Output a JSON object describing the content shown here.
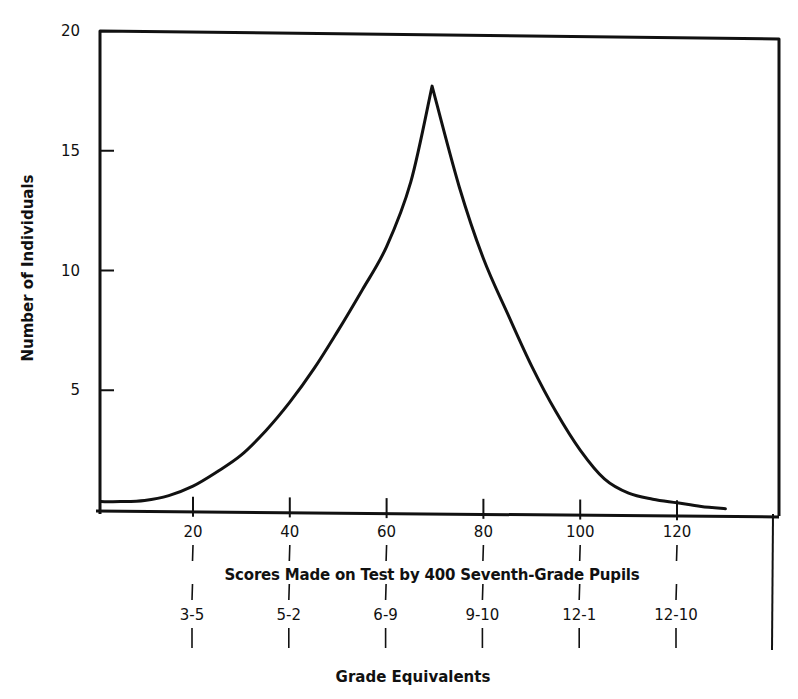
{
  "chart_data": {
    "type": "line",
    "title": "",
    "xlabel": "Scores Made on Test by 400 Seventh-Grade Pupils",
    "ylabel": "Number of Individuals",
    "secondary_xlabel": "Grade Equivalents",
    "ylim": [
      0,
      20
    ],
    "xlim": [
      0,
      140
    ],
    "grid": false,
    "legend": null,
    "y_ticks": [
      5,
      10,
      15,
      20
    ],
    "x_ticks": [
      20,
      40,
      60,
      80,
      100,
      120
    ],
    "x_tick_labels": [
      "20",
      "40",
      "60",
      "80",
      "100",
      "120"
    ],
    "grade_equivalents": [
      "3-5",
      "5-2",
      "6-9",
      "9-10",
      "12-1",
      "12-10"
    ],
    "series": [
      {
        "name": "Distribution of scores",
        "x": [
          1,
          5,
          10,
          15,
          20,
          25,
          30,
          35,
          40,
          45,
          50,
          55,
          60,
          65,
          69.4,
          75,
          80,
          85,
          90,
          95,
          100,
          105,
          110,
          115,
          120,
          125,
          130
        ],
        "values": [
          0.35,
          0.35,
          0.4,
          0.6,
          1.0,
          1.6,
          2.3,
          3.3,
          4.5,
          5.9,
          7.5,
          9.2,
          11.0,
          13.7,
          17.7,
          13.5,
          10.5,
          8.2,
          6.0,
          4.1,
          2.5,
          1.3,
          0.7,
          0.45,
          0.3,
          0.15,
          0.05
        ]
      }
    ]
  }
}
